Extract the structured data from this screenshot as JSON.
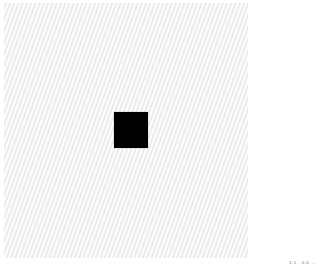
{
  "image": {
    "background_color": "#f2f2f2",
    "texture": "diagonal light gray stripes",
    "shape": {
      "type": "square",
      "color": "#000000",
      "x": 114,
      "y": 112,
      "width": 34,
      "height": 36
    },
    "caption": "1:1 . 0.0 ..."
  }
}
